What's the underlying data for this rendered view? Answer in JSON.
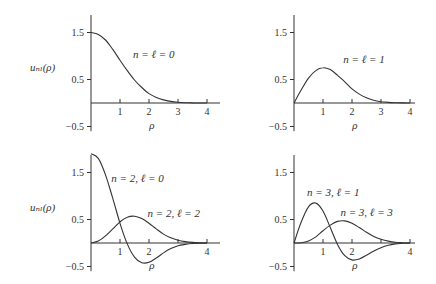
{
  "ylabel_left": "uₙₗ(ρ)",
  "chart_data": [
    {
      "type": "line",
      "panel": "top-left",
      "xlabel": "ρ",
      "ylabel": "u_{nℓ}(ρ)",
      "xlim": [
        0,
        4.2
      ],
      "ylim": [
        -0.6,
        1.9
      ],
      "xticks": [
        1,
        2,
        3,
        4
      ],
      "yticks": [
        1.5,
        0.5,
        -0.5
      ],
      "series": [
        {
          "name": "n = ℓ = 0",
          "x": [
            0,
            0.25,
            0.5,
            0.75,
            1,
            1.25,
            1.5,
            1.75,
            2,
            2.25,
            2.5,
            2.75,
            3,
            3.25,
            3.5,
            3.75,
            4
          ],
          "y": [
            1.5,
            1.46,
            1.34,
            1.14,
            0.91,
            0.69,
            0.49,
            0.33,
            0.2,
            0.12,
            0.066,
            0.034,
            0.016,
            0.007,
            0.003,
            0.001,
            0.0
          ]
        }
      ],
      "annotations": [
        {
          "text": "n = ℓ = 0",
          "x": 1.45,
          "y": 0.95
        }
      ]
    },
    {
      "type": "line",
      "panel": "top-right",
      "xlabel": "ρ",
      "ylabel": "",
      "xlim": [
        0,
        4.2
      ],
      "ylim": [
        -0.6,
        1.9
      ],
      "xticks": [
        1,
        2,
        3,
        4
      ],
      "yticks": [
        1.5,
        0.5,
        -0.5
      ],
      "series": [
        {
          "name": "n = ℓ = 1",
          "x": [
            0,
            0.25,
            0.5,
            0.75,
            1,
            1.25,
            1.5,
            1.75,
            2,
            2.25,
            2.5,
            2.75,
            3,
            3.25,
            3.5,
            3.75,
            4
          ],
          "y": [
            0,
            0.28,
            0.53,
            0.69,
            0.75,
            0.71,
            0.59,
            0.45,
            0.3,
            0.19,
            0.11,
            0.058,
            0.028,
            0.013,
            0.005,
            0.002,
            0.0
          ]
        }
      ],
      "annotations": [
        {
          "text": "n = ℓ = 1",
          "x": 1.7,
          "y": 0.85
        }
      ]
    },
    {
      "type": "line",
      "panel": "bottom-left",
      "xlabel": "ρ",
      "ylabel": "u_{nℓ}(ρ)",
      "xlim": [
        0,
        4.2
      ],
      "ylim": [
        -0.6,
        1.9
      ],
      "xticks": [
        1,
        2,
        4
      ],
      "minor_xticks": [
        3
      ],
      "yticks": [
        1.5,
        0.5,
        -0.5
      ],
      "series": [
        {
          "name": "n = 2, ℓ = 0",
          "x": [
            0,
            0.25,
            0.5,
            0.75,
            1,
            1.25,
            1.5,
            1.75,
            2,
            2.25,
            2.5,
            2.75,
            3,
            3.25,
            3.5,
            3.75,
            4
          ],
          "y": [
            1.9,
            1.8,
            1.45,
            0.95,
            0.42,
            -0.02,
            -0.3,
            -0.42,
            -0.41,
            -0.32,
            -0.21,
            -0.12,
            -0.06,
            -0.03,
            -0.01,
            -0.004,
            0.0
          ]
        },
        {
          "name": "n = 2, ℓ = 2",
          "x": [
            0,
            0.25,
            0.5,
            0.75,
            1,
            1.25,
            1.5,
            1.75,
            2,
            2.25,
            2.5,
            2.75,
            3,
            3.25,
            3.5,
            3.75,
            4
          ],
          "y": [
            0,
            0.04,
            0.15,
            0.3,
            0.45,
            0.55,
            0.57,
            0.52,
            0.42,
            0.3,
            0.19,
            0.11,
            0.06,
            0.03,
            0.012,
            0.004,
            0.0
          ]
        }
      ],
      "annotations": [
        {
          "text": "n = 2,   ℓ = 0",
          "x": 0.7,
          "y": 1.3
        },
        {
          "text": "n = 2,   ℓ = 2",
          "x": 1.95,
          "y": 0.55
        }
      ]
    },
    {
      "type": "line",
      "panel": "bottom-right",
      "xlabel": "ρ",
      "ylabel": "",
      "xlim": [
        0,
        4.2
      ],
      "ylim": [
        -0.6,
        1.9
      ],
      "xticks": [
        1,
        2,
        4
      ],
      "minor_xticks": [
        3
      ],
      "yticks": [
        1.5,
        0.5,
        -0.5
      ],
      "series": [
        {
          "name": "n = 3, ℓ = 1",
          "x": [
            0,
            0.25,
            0.5,
            0.75,
            1,
            1.25,
            1.5,
            1.75,
            2,
            2.25,
            2.5,
            2.75,
            3,
            3.25,
            3.5,
            3.75,
            4
          ],
          "y": [
            0,
            0.45,
            0.77,
            0.85,
            0.68,
            0.33,
            -0.03,
            -0.27,
            -0.36,
            -0.34,
            -0.26,
            -0.17,
            -0.1,
            -0.05,
            -0.02,
            -0.007,
            0.0
          ]
        },
        {
          "name": "n = 3, ℓ = 3",
          "x": [
            0,
            0.25,
            0.5,
            0.75,
            1,
            1.25,
            1.5,
            1.75,
            2,
            2.25,
            2.5,
            2.75,
            3,
            3.25,
            3.5,
            3.75,
            4
          ],
          "y": [
            0,
            0.005,
            0.04,
            0.13,
            0.26,
            0.38,
            0.46,
            0.47,
            0.42,
            0.33,
            0.23,
            0.14,
            0.08,
            0.04,
            0.015,
            0.005,
            0.0
          ]
        }
      ],
      "annotations": [
        {
          "text": "n = 3,   ℓ = 1",
          "x": 0.45,
          "y": 1.0
        },
        {
          "text": "n = 3,   ℓ = 3",
          "x": 1.6,
          "y": 0.58
        }
      ]
    }
  ]
}
